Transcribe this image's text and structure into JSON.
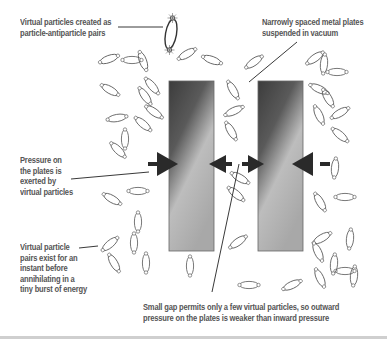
{
  "diagram": {
    "labels": {
      "virtual_pairs_created": [
        "Virtual particles created as",
        "particle-antiparticle pairs"
      ],
      "metal_plates": [
        "Narrowly spaced metal plates",
        "suspended in vacuum"
      ],
      "pressure": [
        "Pressure on",
        "the plates is",
        "exerted by",
        "virtual particles"
      ],
      "pairs_exist": [
        "Virtual particle",
        "pairs exist for an",
        "instant before",
        "annihilating in a",
        "tiny burst of energy"
      ],
      "small_gap": [
        "Small gap permits only a few virtual particles, so outward",
        "pressure on the plates is weaker than inward pressure"
      ]
    },
    "colors": {
      "text": "#555555",
      "line": "#222222",
      "arrow": "#2a2a2a",
      "plate_dark": "#3a3a3a",
      "plate_light": "#d0d0d0",
      "particle": "#555555"
    }
  }
}
